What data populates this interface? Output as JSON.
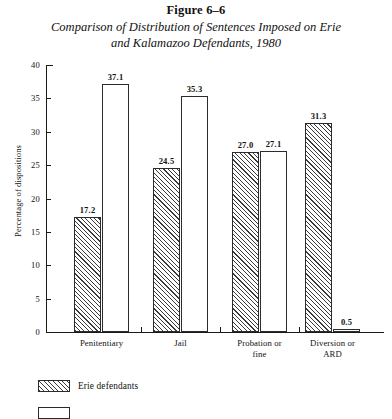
{
  "figure": {
    "number": "Figure 6–6",
    "title_line1": "Comparison of Distribution of Sentences Imposed on Erie",
    "title_line2": "and Kalamazoo Defendants, 1980"
  },
  "legend": {
    "items": [
      {
        "label": "Erie defendants",
        "swatch": "hatched",
        "color": "#3a3a3a"
      },
      {
        "label": "",
        "swatch": "white",
        "color": "#ffffff"
      }
    ]
  },
  "chart_data": {
    "type": "bar",
    "title": "Comparison of Distribution of Sentences Imposed on Erie and Kalamazoo Defendants, 1980",
    "xlabel": "",
    "ylabel": "Percentage of dispositions",
    "ylim": [
      0,
      40
    ],
    "yticks": [
      0,
      5,
      10,
      15,
      20,
      25,
      30,
      35,
      40
    ],
    "ytick_labels": [
      "0",
      "5",
      "10",
      "15",
      "20",
      "25",
      "30",
      "35",
      "40"
    ],
    "grid": false,
    "legend_position": "below-plot-left",
    "categories": [
      "Penitentiary",
      "Jail",
      "Probation or fine",
      "Diversion or ARD"
    ],
    "category_label_lines": [
      [
        "Penitentiary"
      ],
      [
        "Jail"
      ],
      [
        "Probation or",
        "fine"
      ],
      [
        "Diversion or",
        "ARD"
      ]
    ],
    "series": [
      {
        "name": "Erie defendants",
        "style": "hatched",
        "values": [
          17.2,
          24.5,
          27.0,
          31.3
        ],
        "value_labels": [
          "17.2",
          "24.5",
          "27.0",
          "31.3"
        ]
      },
      {
        "name": "Kalamazoo defendants",
        "style": "white",
        "values": [
          37.1,
          35.3,
          27.1,
          0.5
        ],
        "value_labels": [
          "37.1",
          "35.3",
          "27.1",
          "0.5"
        ]
      }
    ]
  }
}
